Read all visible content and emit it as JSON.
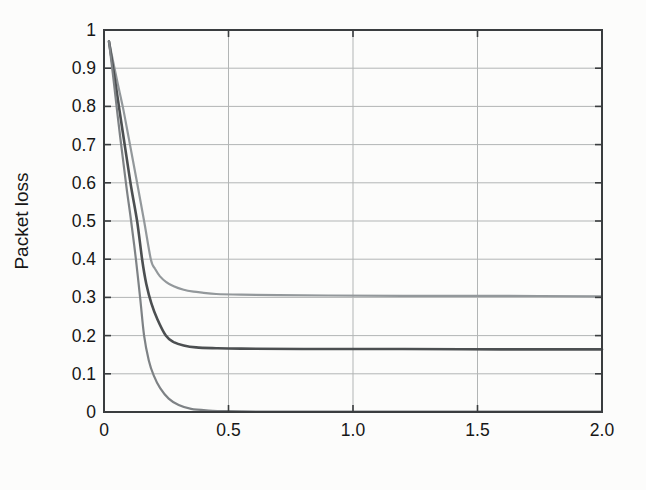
{
  "figure_type": "scanned grayscale line plot",
  "chart_data": {
    "type": "line",
    "title": "",
    "xlabel": "Packet service rate, pkt/second",
    "xlabel_parts": [
      {
        "text": "Packet ",
        "bold": false
      },
      {
        "text": "service",
        "bold": true
      },
      {
        "text": " rate, pkt/second",
        "bold": false
      }
    ],
    "ylabel": "Packet loss",
    "xlim": [
      0,
      2
    ],
    "ylim": [
      0,
      1
    ],
    "grid": true,
    "x_ticks": [
      {
        "v": 0,
        "label": "0"
      },
      {
        "v": 0.5,
        "label": "0.5"
      },
      {
        "v": 1.0,
        "label": "1.0"
      },
      {
        "v": 1.5,
        "label": "1.5"
      },
      {
        "v": 2.0,
        "label": "2.0"
      }
    ],
    "y_ticks": [
      {
        "v": 0,
        "label": "0"
      },
      {
        "v": 0.1,
        "label": "0.1"
      },
      {
        "v": 0.2,
        "label": "0.2"
      },
      {
        "v": 0.3,
        "label": "0.3"
      },
      {
        "v": 0.4,
        "label": "0.4"
      },
      {
        "v": 0.5,
        "label": "0.5"
      },
      {
        "v": 0.6,
        "label": "0.6"
      },
      {
        "v": 0.7,
        "label": "0.7"
      },
      {
        "v": 0.8,
        "label": "0.8"
      },
      {
        "v": 0.9,
        "label": "0.9"
      },
      {
        "v": 1,
        "label": "1"
      }
    ],
    "legend": {
      "position": "top-right",
      "entries": [
        "k=1",
        "k=2",
        "k=3"
      ]
    },
    "colors": {
      "frame": "#3a3d3f",
      "grid": "#b2b5b5",
      "text": "#161616",
      "legend_border": "#3a3d3f",
      "legend_fill": "#fdfdfc"
    },
    "series": [
      {
        "name": "k=1",
        "color": "#93989b",
        "width": 2.2,
        "asymptote": 0.303,
        "points": [
          [
            0.02,
            0.97
          ],
          [
            0.05,
            0.875
          ],
          [
            0.075,
            0.8
          ],
          [
            0.1,
            0.715
          ],
          [
            0.13,
            0.61
          ],
          [
            0.161,
            0.5
          ],
          [
            0.188,
            0.4
          ],
          [
            0.205,
            0.375
          ],
          [
            0.225,
            0.355
          ],
          [
            0.25,
            0.34
          ],
          [
            0.28,
            0.329
          ],
          [
            0.32,
            0.32
          ],
          [
            0.36,
            0.315
          ],
          [
            0.4,
            0.312
          ],
          [
            0.45,
            0.309
          ],
          [
            0.55,
            0.307
          ],
          [
            0.7,
            0.306
          ],
          [
            0.9,
            0.305
          ],
          [
            1.2,
            0.304
          ],
          [
            1.6,
            0.304
          ],
          [
            2.0,
            0.303
          ]
        ]
      },
      {
        "name": "k=2",
        "color": "#4c4f51",
        "width": 2.6,
        "asymptote": 0.164,
        "points": [
          [
            0.02,
            0.97
          ],
          [
            0.045,
            0.865
          ],
          [
            0.06,
            0.8
          ],
          [
            0.09,
            0.67
          ],
          [
            0.11,
            0.585
          ],
          [
            0.133,
            0.5
          ],
          [
            0.153,
            0.4
          ],
          [
            0.17,
            0.335
          ],
          [
            0.19,
            0.285
          ],
          [
            0.215,
            0.242
          ],
          [
            0.248,
            0.2
          ],
          [
            0.28,
            0.183
          ],
          [
            0.32,
            0.174
          ],
          [
            0.37,
            0.169
          ],
          [
            0.45,
            0.167
          ],
          [
            0.55,
            0.166
          ],
          [
            0.8,
            0.165
          ],
          [
            1.2,
            0.165
          ],
          [
            1.6,
            0.164
          ],
          [
            2.0,
            0.164
          ]
        ]
      },
      {
        "name": "k=3",
        "color": "#7e8285",
        "width": 2.2,
        "asymptote": 0.0,
        "points": [
          [
            0.02,
            0.97
          ],
          [
            0.04,
            0.86
          ],
          [
            0.065,
            0.72
          ],
          [
            0.09,
            0.59
          ],
          [
            0.109,
            0.5
          ],
          [
            0.128,
            0.4
          ],
          [
            0.145,
            0.3
          ],
          [
            0.161,
            0.2
          ],
          [
            0.18,
            0.135
          ],
          [
            0.2,
            0.095
          ],
          [
            0.225,
            0.063
          ],
          [
            0.26,
            0.035
          ],
          [
            0.3,
            0.018
          ],
          [
            0.35,
            0.008
          ],
          [
            0.42,
            0.004
          ],
          [
            0.5,
            0.002
          ],
          [
            0.7,
            0.001
          ],
          [
            1.0,
            0.001
          ],
          [
            1.5,
            0.001
          ],
          [
            2.0,
            0.001
          ]
        ]
      }
    ]
  }
}
